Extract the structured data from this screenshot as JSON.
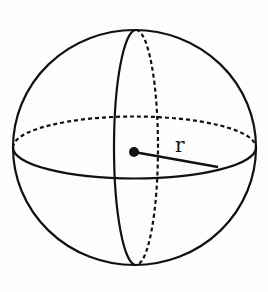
{
  "diagram": {
    "type": "sphere",
    "center_point": {
      "x": 134,
      "y": 152
    },
    "outline": {
      "cx": 134.5,
      "cy": 147.5,
      "rx": 121.5,
      "ry": 117.5
    },
    "equator": {
      "cx": 134.5,
      "cy": 147.5,
      "rx": 121.5,
      "ry": 31,
      "front_style": "solid",
      "back_style": "dashed"
    },
    "meridian": {
      "cx": 136,
      "cy": 147.5,
      "rx": 22,
      "ry": 117.5,
      "front_style": "solid",
      "back_style": "dashed"
    },
    "radius_line": {
      "x1": 134,
      "y1": 152,
      "x2": 218,
      "y2": 167
    },
    "radius_label": "r",
    "stroke_color": "#111111",
    "background_color": "#fdfdfd"
  }
}
